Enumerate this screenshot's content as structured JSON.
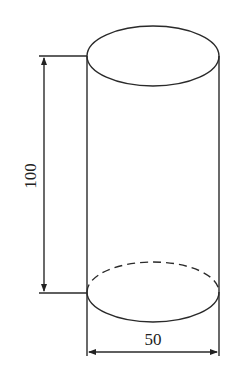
{
  "diagram": {
    "type": "engineering-drawing",
    "stroke_color": "#2a2a2a",
    "background": "#ffffff",
    "cylinder": {
      "left_x": 87,
      "right_x": 219,
      "top_center_y": 56,
      "bottom_center_y": 292,
      "ellipse_ry": 30,
      "bottom_back_edge": "dashed"
    },
    "dimensions": {
      "height": {
        "label": "100",
        "orientation": "vertical",
        "line_x": 44
      },
      "diameter": {
        "label": "50",
        "orientation": "horizontal",
        "line_y": 352
      }
    }
  }
}
